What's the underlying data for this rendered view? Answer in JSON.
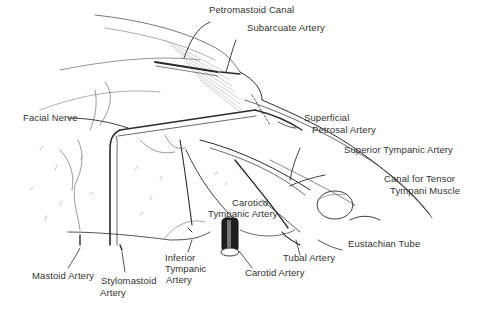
{
  "figure": {
    "type": "anatomical-illustration",
    "colors": {
      "background": "#ffffff",
      "ink": "#222222",
      "label": "#333333"
    }
  },
  "labels": {
    "petromastoid_canal": "Petromastoid Canal",
    "subarcuate_artery": "Subarcuate Artery",
    "facial_nerve": "Facial Nerve",
    "superficial_petrosal_artery_1": "Superficial",
    "superficial_petrosal_artery_2": "Petrosal Artery",
    "superior_tympanic_artery": "Superior Tympanic Artery",
    "canal_tensor_1": "Canal for Tensor",
    "canal_tensor_2": "Tympani Muscle",
    "carotico_tympanic_1": "Carotico",
    "carotico_tympanic_2": "Tympanic Artery",
    "eustachian_tube": "Eustachian Tube",
    "tubal_artery": "Tubal Artery",
    "carotid_artery": "Carotid Artery",
    "inferior_tympanic_1": "Inferior",
    "inferior_tympanic_2": "Tympanic",
    "inferior_tympanic_3": "Artery",
    "stylomastoid_1": "Stylomastoid",
    "stylomastoid_2": "Artery",
    "mastoid_artery": "Mastoid Artery"
  }
}
